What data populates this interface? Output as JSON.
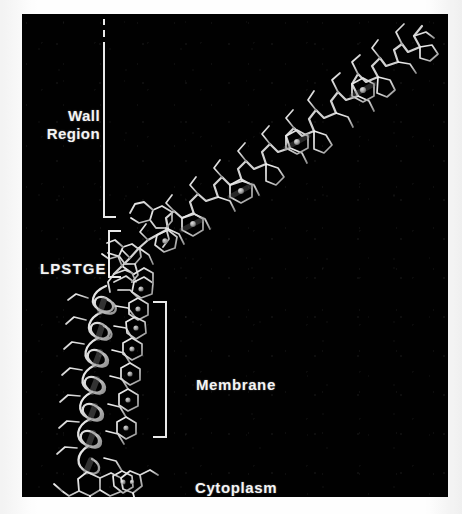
{
  "figure": {
    "kind": "molecular-structure-illustration",
    "background_color": "#ffffff",
    "panel_color": "#010101",
    "structure_color": "#d8d8d8",
    "label_color": "#f4f4f4",
    "description_alt": "Wireframe molecular model of a cell-wall-anchored surface protein spanning the cytoplasm, membrane, LPSTGE sorting signal and wall region."
  },
  "labels": {
    "wall_region": "Wall\nRegion",
    "wall_region_line1": "Wall",
    "wall_region_line2": "Region",
    "lpstge": "LPSTGE",
    "membrane": "Membrane",
    "cytoplasm": "Cytoplasm"
  },
  "brackets": [
    {
      "name": "wall-region-bracket",
      "for_label": "Wall Region",
      "orientation": "ticks-right",
      "dashed_top": true
    },
    {
      "name": "lpstge-bracket",
      "for_label": "LPSTGE",
      "orientation": "ticks-right",
      "dashed_top": false
    },
    {
      "name": "membrane-bracket",
      "for_label": "Membrane",
      "orientation": "ticks-left",
      "dashed_top": false
    }
  ]
}
